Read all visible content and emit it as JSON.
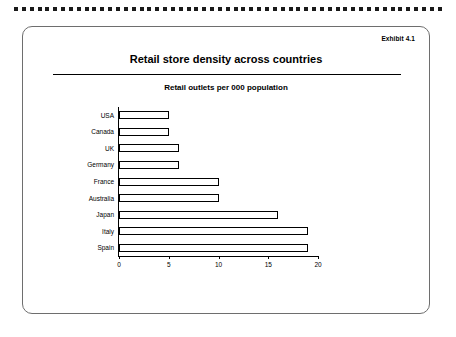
{
  "exhibit": {
    "label": "Exhibit 4.1"
  },
  "card": {
    "title": "Retail store density across countries"
  },
  "chart_data": {
    "type": "bar",
    "orientation": "horizontal",
    "title": "Retail outlets per 000 population",
    "subtitle": "",
    "xlabel": "",
    "ylabel": "",
    "categories": [
      "USA",
      "Canada",
      "UK",
      "Germany",
      "France",
      "Australia",
      "Japan",
      "Italy",
      "Spain"
    ],
    "values": [
      5,
      5,
      6,
      6,
      10,
      10,
      16,
      19,
      19
    ],
    "xlim": [
      0,
      20
    ],
    "xticks": [
      0,
      5,
      10,
      15,
      20
    ],
    "xtick_labels": [
      "0",
      "5",
      "10",
      "15",
      "20"
    ],
    "grid": false,
    "legend": null,
    "bar_fill": "#ffffff",
    "bar_stroke": "#000000"
  }
}
